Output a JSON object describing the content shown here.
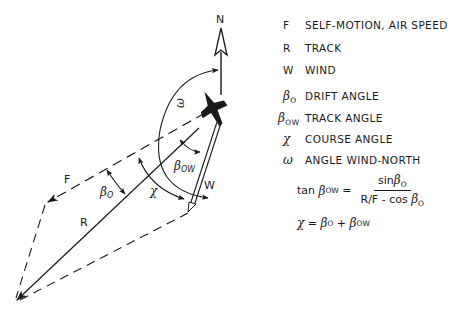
{
  "diagram": {
    "north_label": "N",
    "vector_labels": {
      "F": "F",
      "R": "R",
      "W": "W"
    },
    "angle_labels": {
      "omega": "ω",
      "beta_ow_main": "β",
      "beta_ow_sub": "OW",
      "beta_o_main": "β",
      "beta_o_sub": "O",
      "chi": "χ"
    }
  },
  "legend": {
    "items": [
      {
        "symbol": "F",
        "sub": "",
        "text": "SELF-MOTION, AIR SPEED"
      },
      {
        "symbol": "R",
        "sub": "",
        "text": "TRACK"
      },
      {
        "symbol": "W",
        "sub": "",
        "text": "WIND"
      },
      {
        "symbol": "β",
        "sub": "O",
        "text": "DRIFT ANGLE"
      },
      {
        "symbol": "β",
        "sub": "OW",
        "text": "TRACK ANGLE"
      },
      {
        "symbol": "χ",
        "sub": "",
        "text": "COURSE ANGLE"
      },
      {
        "symbol": "ω",
        "sub": "",
        "text": "ANGLE WIND-NORTH"
      }
    ]
  },
  "formulas": {
    "f1": {
      "lhs_fn": "tan",
      "lhs_sym": "β",
      "lhs_sub": "OW",
      "eq": "=",
      "num_fn": "sin",
      "num_sym": "β",
      "num_sub": "O",
      "den_prefix": "R/F - cos",
      "den_sym": "β",
      "den_sub": "O"
    },
    "f2": {
      "lhs": "χ",
      "eq": "=",
      "t1_sym": "β",
      "t1_sub": "O",
      "plus": "+",
      "t2_sym": "β",
      "t2_sub": "OW"
    }
  },
  "colors": {
    "ink": "#1a1a1a",
    "background": "#ffffff"
  }
}
